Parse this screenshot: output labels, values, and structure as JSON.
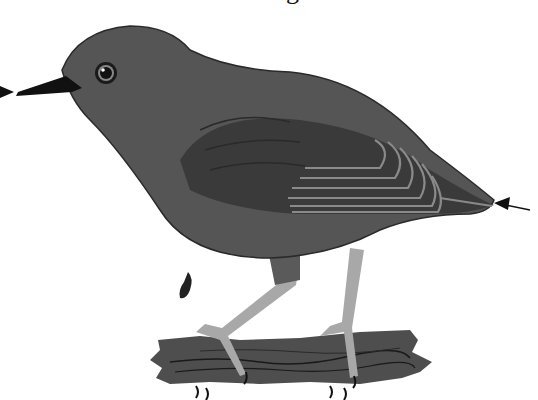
{
  "image": {
    "subject": "bird illustration",
    "description": "Dark grey songbird (dipper-like) standing on a log, with measurement arrows at beak tip and tail tip",
    "caption_fragment": "g"
  },
  "annotations": {
    "left_arrow": {
      "direction": "right",
      "target": "beak-tip"
    },
    "right_arrow": {
      "direction": "left",
      "target": "tail-tip"
    }
  },
  "colors": {
    "background": "#ffffff",
    "body": "#555555",
    "wing_dark": "#3a3a3a",
    "wing_stripes": "#8a8a8a",
    "legs": "#a8a8a8",
    "log": "#4e4e4e",
    "outline": "#1a1a1a"
  }
}
